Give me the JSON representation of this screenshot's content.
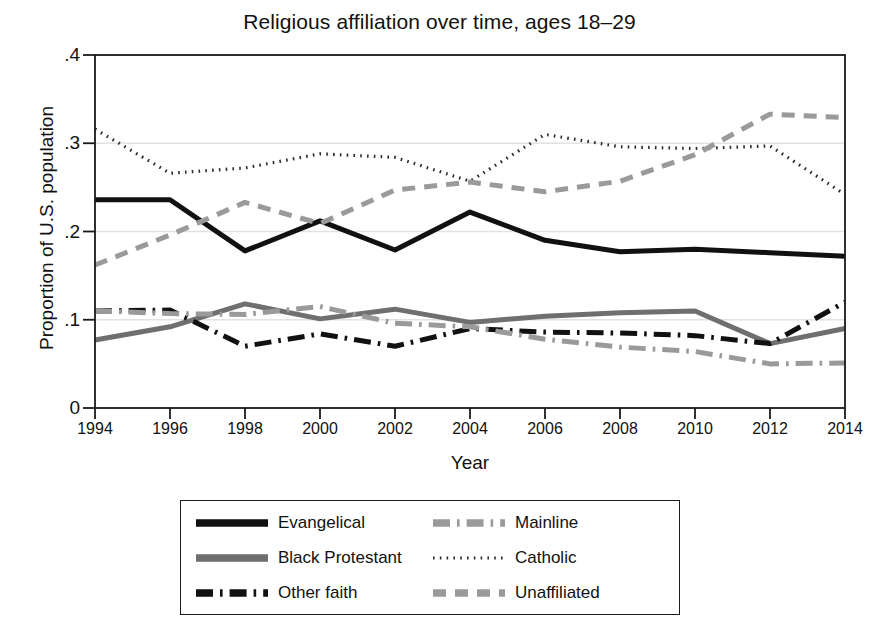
{
  "chart_data": {
    "type": "line",
    "title": "Religious affiliation over time, ages 18–29",
    "xlabel": "Year",
    "ylabel": "Proportion of U.S. population",
    "x": [
      1994,
      1996,
      1998,
      2000,
      2002,
      2004,
      2006,
      2008,
      2010,
      2012,
      2014
    ],
    "xticklabels": [
      "1994",
      "1996",
      "1998",
      "2000",
      "2002",
      "2004",
      "2006",
      "2008",
      "2010",
      "2012",
      "2014"
    ],
    "yticklabels": [
      "0",
      ".1",
      ".2",
      ".3",
      ".4"
    ],
    "ytickvalues": [
      0,
      0.1,
      0.2,
      0.3,
      0.4
    ],
    "xlim": [
      1994,
      2014
    ],
    "ylim": [
      0,
      0.4
    ],
    "grid": true,
    "legend_position": "below-center",
    "series": [
      {
        "name": "Evangelical",
        "style": "solid",
        "color": "#111111",
        "width": 5.0,
        "values": [
          0.236,
          0.236,
          0.178,
          0.212,
          0.179,
          0.222,
          0.19,
          0.177,
          0.18,
          0.176,
          0.172
        ]
      },
      {
        "name": "Black Protestant",
        "style": "solid",
        "color": "#6f6f6f",
        "width": 5.0,
        "values": [
          0.077,
          0.092,
          0.118,
          0.101,
          0.112,
          0.097,
          0.104,
          0.108,
          0.11,
          0.073,
          0.09
        ]
      },
      {
        "name": "Other faith",
        "style": "dash-dot",
        "color": "#111111",
        "width": 5.0,
        "values": [
          0.11,
          0.111,
          0.07,
          0.084,
          0.07,
          0.09,
          0.086,
          0.085,
          0.082,
          0.073,
          0.12
        ]
      },
      {
        "name": "Mainline",
        "style": "dash-dot",
        "color": "#9a9a9a",
        "width": 5.0,
        "values": [
          0.11,
          0.107,
          0.106,
          0.115,
          0.096,
          0.092,
          0.078,
          0.069,
          0.064,
          0.05,
          0.051
        ]
      },
      {
        "name": "Catholic",
        "style": "dotted",
        "color": "#2b2b2b",
        "width": 3.2,
        "values": [
          0.316,
          0.266,
          0.272,
          0.288,
          0.284,
          0.257,
          0.31,
          0.296,
          0.294,
          0.297,
          0.242
        ]
      },
      {
        "name": "Unaffiliated",
        "style": "dashed",
        "color": "#9a9a9a",
        "width": 5.0,
        "values": [
          0.162,
          0.196,
          0.233,
          0.209,
          0.247,
          0.256,
          0.245,
          0.257,
          0.287,
          0.333,
          0.329
        ]
      }
    ]
  },
  "legend": {
    "entries": [
      {
        "label": "Evangelical",
        "series": 0
      },
      {
        "label": "Mainline",
        "series": 3
      },
      {
        "label": "Black Protestant",
        "series": 1
      },
      {
        "label": "Catholic",
        "series": 4
      },
      {
        "label": "Other faith",
        "series": 2
      },
      {
        "label": "Unaffiliated",
        "series": 5
      }
    ]
  },
  "plot_area": {
    "left": 95,
    "top": 55,
    "right": 845,
    "bottom": 408,
    "border_color": "#1a1a1a",
    "grid_color": "#e2e2e2",
    "background": "#ffffff"
  }
}
